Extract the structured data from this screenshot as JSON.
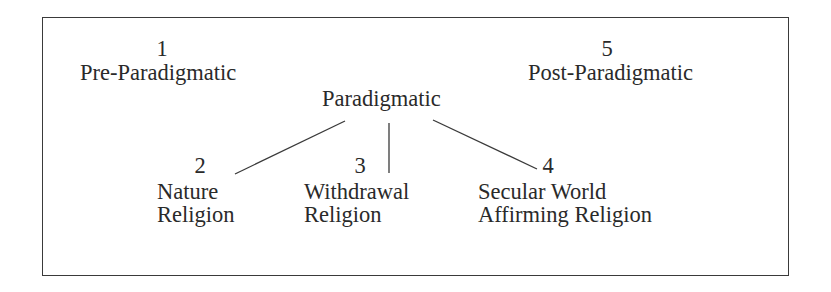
{
  "diagram": {
    "stages": [
      {
        "number": "1",
        "label": "Pre-Paradigmatic"
      },
      {
        "number": "5",
        "label": "Post-Paradigmatic"
      }
    ],
    "root": {
      "label": "Paradigmatic"
    },
    "branches": [
      {
        "number": "2",
        "line1": "Nature",
        "line2": "Religion"
      },
      {
        "number": "3",
        "line1": "Withdrawal",
        "line2": "Religion"
      },
      {
        "number": "4",
        "line1": "Secular World",
        "line2": "Affirming Religion"
      }
    ],
    "colors": {
      "text": "#2a2a2a",
      "line": "#3a3a3a",
      "background": "#ffffff"
    }
  }
}
